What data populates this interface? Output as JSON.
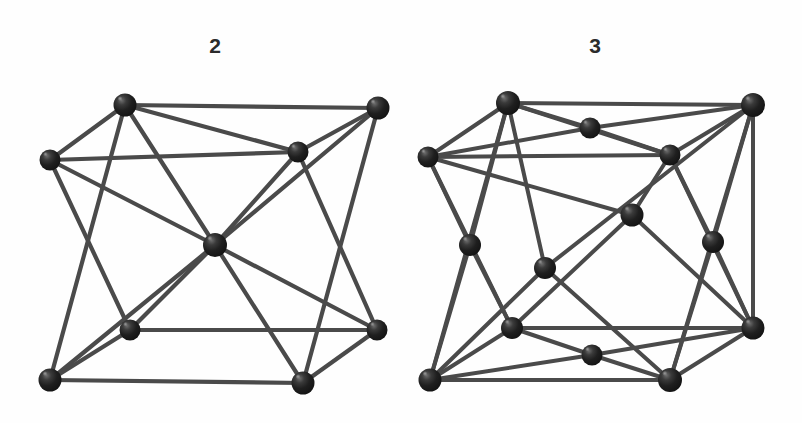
{
  "figure": {
    "background_color": "#fefefe",
    "edge_color": "#4a4a4a",
    "node_color": "#1c1c1c",
    "node_highlight_color": "#8d8d8d",
    "label_color": "#2b2b2b"
  },
  "cells": [
    {
      "id": "bcc",
      "label": "2",
      "label_x": 215,
      "label_y": 50,
      "structure": "body-centered-cubic",
      "node_radius": 10.5,
      "edge_width": 4.2,
      "nodes": [
        {
          "name": "back-top-left",
          "x": 50,
          "y": 160,
          "r": 10.5
        },
        {
          "name": "back-top-right",
          "x": 298,
          "y": 152,
          "r": 10.5
        },
        {
          "name": "back-bottom-left",
          "x": 130,
          "y": 330,
          "r": 10.5
        },
        {
          "name": "back-bottom-right",
          "x": 377,
          "y": 330,
          "r": 10.5
        },
        {
          "name": "front-top-left",
          "x": 125,
          "y": 105,
          "r": 11.5
        },
        {
          "name": "front-top-right",
          "x": 378,
          "y": 108,
          "r": 11.5
        },
        {
          "name": "front-bottom-left",
          "x": 50,
          "y": 380,
          "r": 11.5
        },
        {
          "name": "front-bottom-right",
          "x": 303,
          "y": 383,
          "r": 11.5
        },
        {
          "name": "body-center",
          "x": 215,
          "y": 245,
          "r": 12.0
        }
      ],
      "edges": [
        [
          0,
          1
        ],
        [
          0,
          2
        ],
        [
          0,
          4
        ],
        [
          1,
          3
        ],
        [
          1,
          4
        ],
        [
          2,
          3
        ],
        [
          2,
          6
        ],
        [
          3,
          7
        ],
        [
          4,
          5
        ],
        [
          4,
          6
        ],
        [
          5,
          7
        ],
        [
          5,
          1
        ],
        [
          6,
          7
        ],
        [
          2,
          6
        ],
        [
          8,
          0
        ],
        [
          8,
          1
        ],
        [
          8,
          2
        ],
        [
          8,
          3
        ],
        [
          8,
          4
        ],
        [
          8,
          5
        ],
        [
          8,
          6
        ],
        [
          8,
          7
        ]
      ]
    },
    {
      "id": "fcc",
      "label": "3",
      "label_x": 598,
      "label_y": 50,
      "structure": "face-centered-cubic",
      "node_radius": 10.5,
      "edge_width": 4.0,
      "nodes": [
        {
          "name": "back-top-left",
          "x": 428,
          "y": 157,
          "r": 10.5
        },
        {
          "name": "back-top-right",
          "x": 670,
          "y": 155,
          "r": 10.5
        },
        {
          "name": "back-bottom-left",
          "x": 512,
          "y": 328,
          "r": 11.0
        },
        {
          "name": "back-bottom-right",
          "x": 753,
          "y": 328,
          "r": 11.5
        },
        {
          "name": "front-top-left",
          "x": 508,
          "y": 103,
          "r": 12.0
        },
        {
          "name": "front-top-right",
          "x": 753,
          "y": 105,
          "r": 12.0
        },
        {
          "name": "front-bottom-left",
          "x": 430,
          "y": 380,
          "r": 11.5
        },
        {
          "name": "front-bottom-right",
          "x": 670,
          "y": 380,
          "r": 12.0
        },
        {
          "name": "face-center-top",
          "x": 590,
          "y": 128,
          "r": 10.5
        },
        {
          "name": "face-center-bottom",
          "x": 592,
          "y": 355,
          "r": 10.5
        },
        {
          "name": "face-center-front",
          "x": 545,
          "y": 268,
          "r": 11.0
        },
        {
          "name": "face-center-back",
          "x": 632,
          "y": 215,
          "r": 11.5
        },
        {
          "name": "face-center-left",
          "x": 470,
          "y": 245,
          "r": 11.0
        },
        {
          "name": "face-center-right",
          "x": 713,
          "y": 242,
          "r": 11.0
        }
      ],
      "edges": [
        [
          0,
          1
        ],
        [
          0,
          2
        ],
        [
          0,
          4
        ],
        [
          1,
          3
        ],
        [
          1,
          4
        ],
        [
          1,
          5
        ],
        [
          2,
          3
        ],
        [
          2,
          6
        ],
        [
          3,
          7
        ],
        [
          3,
          5
        ],
        [
          4,
          5
        ],
        [
          4,
          6
        ],
        [
          5,
          7
        ],
        [
          6,
          7
        ],
        [
          8,
          0
        ],
        [
          8,
          1
        ],
        [
          8,
          4
        ],
        [
          8,
          5
        ],
        [
          9,
          2
        ],
        [
          9,
          3
        ],
        [
          9,
          6
        ],
        [
          9,
          7
        ],
        [
          10,
          4
        ],
        [
          10,
          5
        ],
        [
          10,
          6
        ],
        [
          10,
          7
        ],
        [
          11,
          0
        ],
        [
          11,
          1
        ],
        [
          11,
          2
        ],
        [
          11,
          3
        ],
        [
          12,
          0
        ],
        [
          12,
          2
        ],
        [
          12,
          4
        ],
        [
          12,
          6
        ],
        [
          13,
          1
        ],
        [
          13,
          3
        ],
        [
          13,
          5
        ],
        [
          13,
          7
        ]
      ]
    }
  ]
}
